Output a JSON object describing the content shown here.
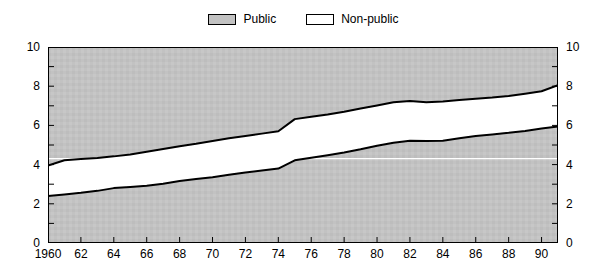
{
  "legend": {
    "entries": [
      {
        "label": "Public",
        "swatch": "public",
        "color": "#c2c2c2"
      },
      {
        "label": "Non-public",
        "swatch": "nonpublic",
        "color": "#ffffff"
      }
    ]
  },
  "chart_data": {
    "type": "area",
    "title": "",
    "subtitle": "",
    "xlabel": "",
    "ylabel": "",
    "xlim": [
      1960,
      1991
    ],
    "ylim": [
      0,
      10
    ],
    "grid": false,
    "legend_position": "top-center",
    "stacked": true,
    "y_ticks_major": [
      0,
      2,
      4,
      6,
      8,
      10
    ],
    "y_ticks_minor": [
      1,
      3,
      5,
      7,
      9
    ],
    "y_tick_labels": [
      "0",
      "2",
      "4",
      "6",
      "8",
      "10"
    ],
    "x_ticks": [
      1960,
      1962,
      1964,
      1966,
      1968,
      1970,
      1972,
      1974,
      1976,
      1978,
      1980,
      1982,
      1984,
      1986,
      1988,
      1990
    ],
    "x_tick_labels": [
      "1960",
      "62",
      "64",
      "66",
      "68",
      "70",
      "72",
      "74",
      "76",
      "78",
      "80",
      "82",
      "84",
      "86",
      "88",
      "90"
    ],
    "reference_line": {
      "y": 4.3,
      "color": "#ffffff"
    },
    "x": [
      1960,
      1961,
      1962,
      1963,
      1964,
      1965,
      1966,
      1967,
      1968,
      1969,
      1970,
      1971,
      1972,
      1973,
      1974,
      1975,
      1976,
      1977,
      1978,
      1979,
      1980,
      1981,
      1982,
      1983,
      1984,
      1985,
      1986,
      1987,
      1988,
      1989,
      1990,
      1991
    ],
    "series": [
      {
        "name": "Public",
        "fill": "#c2c2c2",
        "values": [
          2.4,
          2.48,
          2.56,
          2.66,
          2.8,
          2.86,
          2.92,
          3.02,
          3.16,
          3.26,
          3.36,
          3.48,
          3.6,
          3.7,
          3.8,
          4.22,
          4.35,
          4.48,
          4.62,
          4.78,
          4.96,
          5.12,
          5.22,
          5.2,
          5.22,
          5.34,
          5.46,
          5.54,
          5.62,
          5.72,
          5.84,
          5.95
        ]
      },
      {
        "name": "Non-public",
        "fill": "#ffffff",
        "upper_values": [
          3.95,
          4.22,
          4.28,
          4.34,
          4.42,
          4.52,
          4.66,
          4.8,
          4.94,
          5.06,
          5.2,
          5.34,
          5.46,
          5.58,
          5.7,
          6.32,
          6.44,
          6.56,
          6.7,
          6.86,
          7.02,
          7.18,
          7.24,
          7.18,
          7.22,
          7.3,
          7.36,
          7.42,
          7.5,
          7.62,
          7.74,
          8.05
        ]
      }
    ]
  }
}
